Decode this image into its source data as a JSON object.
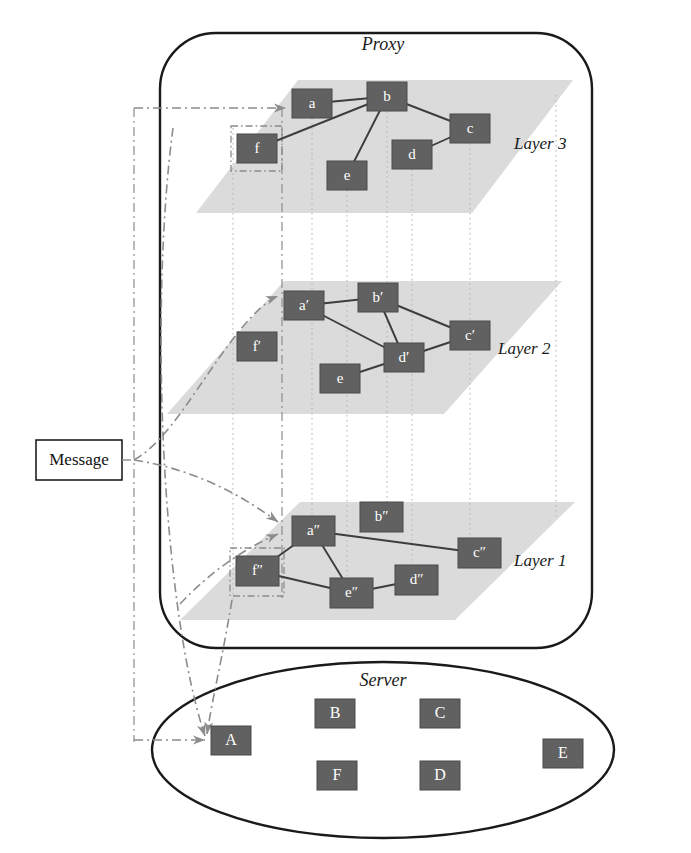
{
  "canvas": {
    "width": 691,
    "height": 853,
    "background": "#ffffff"
  },
  "colors": {
    "node_fill": "#616161",
    "node_stroke": "#4a4a4a",
    "node_text": "#ffffff",
    "plane_fill": "#d9d9d9",
    "region_stroke": "#1a1a1a",
    "edge_stroke": "#3d3d3d",
    "flow_stroke": "#8c8c8c",
    "guide_stroke": "#b3b3b3",
    "highlight_stroke": "#8c8c8c",
    "label_text": "#1a1a1a"
  },
  "regions": [
    {
      "id": "proxy",
      "label": "Proxy",
      "shape": "rounded-rect",
      "x": 160,
      "y": 33,
      "width": 432,
      "height": 615,
      "radius": 56,
      "label_x": 383,
      "label_y": 46
    },
    {
      "id": "server",
      "label": "Server",
      "shape": "ellipse",
      "cx": 383,
      "cy": 750,
      "rx": 231,
      "ry": 88,
      "label_x": 383,
      "label_y": 682
    }
  ],
  "message_box": {
    "label": "Message",
    "x": 36,
    "y": 440,
    "width": 86,
    "height": 40,
    "text_x": 79,
    "text_y": 461
  },
  "layers": [
    {
      "id": "layer3",
      "label": "Layer 3",
      "label_x": 514,
      "label_y": 145,
      "plane": {
        "points": "298,80 573,80 472,213 196,213"
      },
      "nodes": [
        {
          "id": "a",
          "label": "a",
          "x": 292,
          "y": 89,
          "w": 40,
          "h": 29
        },
        {
          "id": "b",
          "label": "b",
          "x": 367,
          "y": 82,
          "w": 40,
          "h": 29
        },
        {
          "id": "c",
          "label": "c",
          "x": 450,
          "y": 114,
          "w": 40,
          "h": 29
        },
        {
          "id": "d",
          "label": "d",
          "x": 392,
          "y": 140,
          "w": 40,
          "h": 29
        },
        {
          "id": "e",
          "label": "e",
          "x": 327,
          "y": 161,
          "w": 40,
          "h": 29
        },
        {
          "id": "f",
          "label": "f",
          "x": 237,
          "y": 134,
          "w": 40,
          "h": 29
        }
      ],
      "edges": [
        {
          "from": "a",
          "to": "b"
        },
        {
          "from": "b",
          "to": "c"
        },
        {
          "from": "b",
          "to": "e"
        },
        {
          "from": "b",
          "to": "f"
        },
        {
          "from": "c",
          "to": "d"
        }
      ],
      "entry_node": "a"
    },
    {
      "id": "layer2",
      "label": "Layer 2",
      "label_x": 498,
      "label_y": 350,
      "plane": {
        "points": "284,281 562,281 444,414 167,414"
      },
      "nodes": [
        {
          "id": "a2",
          "label": "a′",
          "x": 284,
          "y": 291,
          "w": 40,
          "h": 29
        },
        {
          "id": "b2",
          "label": "b′",
          "x": 358,
          "y": 283,
          "w": 40,
          "h": 29
        },
        {
          "id": "c2",
          "label": "c′",
          "x": 450,
          "y": 321,
          "w": 40,
          "h": 29
        },
        {
          "id": "d2",
          "label": "d′",
          "x": 384,
          "y": 343,
          "w": 40,
          "h": 29
        },
        {
          "id": "e2",
          "label": "e",
          "x": 320,
          "y": 364,
          "w": 40,
          "h": 29
        },
        {
          "id": "f2",
          "label": "f′",
          "x": 237,
          "y": 332,
          "w": 40,
          "h": 29
        }
      ],
      "edges": [
        {
          "from": "a2",
          "to": "b2"
        },
        {
          "from": "a2",
          "to": "d2"
        },
        {
          "from": "b2",
          "to": "c2"
        },
        {
          "from": "b2",
          "to": "d2"
        },
        {
          "from": "c2",
          "to": "d2"
        },
        {
          "from": "d2",
          "to": "e2"
        }
      ],
      "entry_node": "a2"
    },
    {
      "id": "layer1",
      "label": "Layer 1",
      "label_x": 514,
      "label_y": 562,
      "plane": {
        "points": "300,502 575,502 455,620 180,620"
      },
      "nodes": [
        {
          "id": "a1",
          "label": "a″",
          "x": 292,
          "y": 516,
          "w": 43,
          "h": 30
        },
        {
          "id": "b1",
          "label": "b″",
          "x": 360,
          "y": 502,
          "w": 43,
          "h": 30
        },
        {
          "id": "c1",
          "label": "c″",
          "x": 458,
          "y": 538,
          "w": 43,
          "h": 30
        },
        {
          "id": "d1",
          "label": "d″",
          "x": 395,
          "y": 565,
          "w": 43,
          "h": 30
        },
        {
          "id": "e1",
          "label": "e″",
          "x": 330,
          "y": 578,
          "w": 43,
          "h": 30
        },
        {
          "id": "f1",
          "label": "f″",
          "x": 236,
          "y": 556,
          "w": 43,
          "h": 30
        }
      ],
      "edges": [
        {
          "from": "a1",
          "to": "c1"
        },
        {
          "from": "a1",
          "to": "f1"
        },
        {
          "from": "a1",
          "to": "e1"
        },
        {
          "from": "f1",
          "to": "e1"
        },
        {
          "from": "e1",
          "to": "d1"
        }
      ],
      "entry_node": "a1"
    }
  ],
  "server_nodes": [
    {
      "id": "A",
      "label": "A",
      "x": 211,
      "y": 726,
      "w": 40,
      "h": 29
    },
    {
      "id": "B",
      "label": "B",
      "x": 315,
      "y": 699,
      "w": 40,
      "h": 29
    },
    {
      "id": "C",
      "label": "C",
      "x": 420,
      "y": 699,
      "w": 40,
      "h": 29
    },
    {
      "id": "E",
      "label": "E",
      "x": 543,
      "y": 739,
      "w": 40,
      "h": 29
    },
    {
      "id": "F",
      "label": "F",
      "x": 317,
      "y": 761,
      "w": 40,
      "h": 29
    },
    {
      "id": "D",
      "label": "D",
      "x": 420,
      "y": 761,
      "w": 40,
      "h": 29
    }
  ],
  "highlight_boxes": [
    {
      "id": "f-highlight",
      "x": 231,
      "y": 126,
      "width": 51,
      "height": 45
    },
    {
      "id": "f1-highlight",
      "x": 230,
      "y": 548,
      "width": 54,
      "height": 48
    }
  ],
  "guide_lines": [
    {
      "id": "guide-f",
      "x": 233,
      "y1": 128,
      "y2": 600
    },
    {
      "id": "guide-a",
      "x": 312,
      "y1": 118,
      "y2": 546
    },
    {
      "id": "guide-b",
      "x": 387,
      "y1": 111,
      "y2": 532
    },
    {
      "id": "guide-e",
      "x": 347,
      "y1": 190,
      "y2": 608
    },
    {
      "id": "guide-d",
      "x": 412,
      "y1": 169,
      "y2": 595
    },
    {
      "id": "guide-c",
      "x": 470,
      "y1": 143,
      "y2": 568
    },
    {
      "id": "guide-r",
      "x": 556,
      "y1": 95,
      "y2": 520
    }
  ],
  "dashdot_guides": [
    {
      "id": "dashdot-left",
      "x": 134,
      "y1": 108,
      "y2": 742
    },
    {
      "id": "dashdot-right",
      "x": 282,
      "y1": 108,
      "y2": 600
    }
  ],
  "flow_arrows": [
    {
      "id": "flow-to-a",
      "path": "M 134 108 L 286 108",
      "target": "a",
      "style": "dash-dot"
    },
    {
      "id": "flow-to-a2",
      "path": "M 134 460 C 170 440 200 380 240 330 C 255 312 268 300 278 296",
      "target": "a′",
      "style": "dash-dot"
    },
    {
      "id": "flow-to-a1",
      "path": "M 134 460 C 200 470 248 500 278 522",
      "target": "a″",
      "style": "dash-dot"
    },
    {
      "id": "flow-to-a1b",
      "path": "M 180 604 C 210 572 245 548 278 534",
      "target": "a″",
      "style": "dash-dot"
    },
    {
      "id": "flow-to-A",
      "path": "M 134 740 L 205 740",
      "target": "A",
      "style": "dash-dot"
    },
    {
      "id": "flow-down-1",
      "path": "M 173 128 C 150 300 160 600 205 736",
      "target": "A",
      "style": "dash-dot"
    },
    {
      "id": "flow-down-2",
      "path": "M 232 600 C 222 660 212 700 207 734",
      "target": "A",
      "style": "dash-dot"
    }
  ]
}
